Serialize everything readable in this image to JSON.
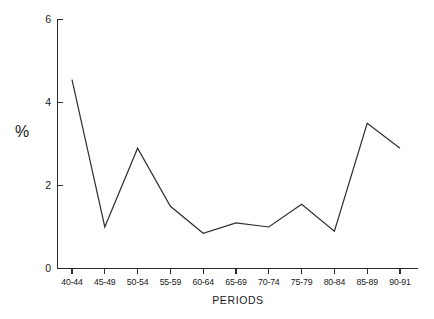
{
  "chart_data": {
    "type": "line",
    "title": "",
    "subtitle": "",
    "xlabel": "PERIODS",
    "ylabel": "%",
    "categories": [
      "40-44",
      "45-49",
      "50-54",
      "55-59",
      "60-64",
      "65-69",
      "70-74",
      "75-79",
      "80-84",
      "85-89",
      "90-91"
    ],
    "values": [
      4.55,
      1.0,
      2.9,
      1.5,
      0.85,
      1.1,
      1.0,
      1.55,
      0.9,
      3.5,
      2.9
    ],
    "series": [
      {
        "name": "",
        "values": [
          4.55,
          1.0,
          2.9,
          1.5,
          0.85,
          1.1,
          1.0,
          1.55,
          0.9,
          3.5,
          2.9
        ]
      }
    ],
    "ylim": [
      0,
      6
    ],
    "ytick_values": [
      0,
      2,
      4,
      6
    ],
    "ytick_labels": [
      "0",
      "2",
      "4",
      "6"
    ],
    "grid": false,
    "legend": false,
    "legend_position": "none",
    "line_color": "#2f2f2f",
    "background_color": "#ffffff",
    "markers": false,
    "annotations": []
  }
}
